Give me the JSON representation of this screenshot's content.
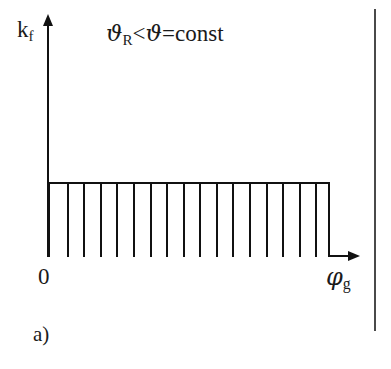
{
  "figure": {
    "caption": "a)",
    "annotation": {
      "theta_symbol": "ϑ",
      "theta_subscript": "R",
      "less_than": "<",
      "theta_symbol_2": "ϑ",
      "equals": "=",
      "const_text": "const",
      "full_text": "ϑR<ϑ=const"
    },
    "axes": {
      "y_label_base": "k",
      "y_label_subscript": "f",
      "y_label_full": "kf",
      "x_label_base": "φ",
      "x_label_subscript": "g",
      "x_label_full": "φg",
      "origin_label": "0"
    },
    "colors": {
      "line": "#111111",
      "border_rule": "#4a4a4a",
      "background": "#ffffff"
    }
  },
  "chart_data": {
    "type": "area",
    "title": "",
    "subtitle": "",
    "xlabel": "φg",
    "ylabel": "kf",
    "annotations": [
      "ϑR<ϑ=const",
      "a)"
    ],
    "grid": false,
    "legend": null,
    "xlim": [
      0,
      1
    ],
    "ylim": [
      0,
      1
    ],
    "xtick_labels": [
      "0",
      "φg"
    ],
    "ytick_labels": [],
    "series": [
      {
        "name": "kf",
        "x": [
          0,
          1
        ],
        "values": [
          0.318,
          0.318
        ],
        "constant_value": 0.318,
        "fill": "vertical-hatch"
      }
    ],
    "hatch": {
      "orientation": "vertical",
      "line_count": 16
    }
  }
}
